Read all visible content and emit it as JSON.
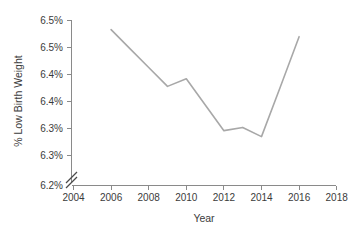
{
  "chart_data": {
    "type": "line",
    "title": "",
    "subtitle": "",
    "xlabel": "Year",
    "ylabel": "% Low Birth Weight",
    "grid": false,
    "legend": false,
    "legend_position": "none",
    "axis_break": true,
    "axis_break_note": "y-axis broken between 6.2% and first plotted value",
    "xlim": [
      2004,
      2018
    ],
    "ylim": [
      6.2,
      6.5
    ],
    "x_ticks": [
      2004,
      2006,
      2008,
      2010,
      2012,
      2014,
      2016,
      2018
    ],
    "x_tick_labels": [
      "2004",
      "2006",
      "2008",
      "2010",
      "2012",
      "2014",
      "2016",
      "2018"
    ],
    "y_ticks": [
      6.2,
      6.25,
      6.3,
      6.35,
      6.4,
      6.45,
      6.5
    ],
    "y_tick_labels": [
      "6.2%",
      "6.3%",
      "6.3%",
      "6.4%",
      "6.4%",
      "6.5%",
      "6.5%"
    ],
    "line_color": "#a8a8a8",
    "axis_color": "#8a8a8a",
    "text_color": "#3b3b3b",
    "x": [
      2006,
      2007,
      2008,
      2009,
      2010,
      2011,
      2012,
      2013,
      2014,
      2015,
      2016
    ],
    "values": [
      6.483,
      6.448,
      6.413,
      6.378,
      6.392,
      6.344,
      6.296,
      6.302,
      6.285,
      6.377,
      6.47
    ],
    "series": [
      {
        "name": "% Low Birth Weight",
        "values": [
          6.483,
          6.448,
          6.413,
          6.378,
          6.392,
          6.344,
          6.296,
          6.302,
          6.285,
          6.377,
          6.47
        ]
      }
    ],
    "annotations": []
  },
  "axes": {
    "y_title": "% Low Birth Weight",
    "x_title": "Year"
  }
}
